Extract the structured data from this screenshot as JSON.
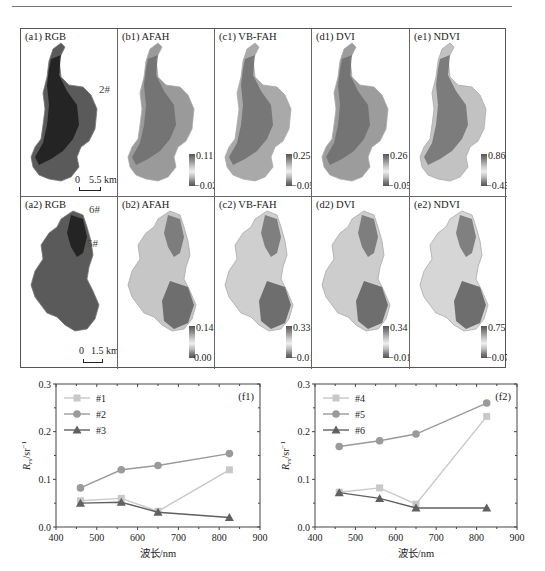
{
  "figure": {
    "row1": [
      {
        "label": "(a1) RGB",
        "type": "rgb",
        "site_tag": "2#",
        "scale": {
          "zero": "0",
          "length": "5.5 km"
        }
      },
      {
        "label": "(b1) AFAH",
        "cbar_max": "0.11",
        "cbar_min": "−0.02"
      },
      {
        "label": "(c1) VB-FAH",
        "cbar_max": "0.25",
        "cbar_min": "−0.05"
      },
      {
        "label": "(d1) DVI",
        "cbar_max": "0.26",
        "cbar_min": "−0.05"
      },
      {
        "label": "(e1) NDVI",
        "cbar_max": "0.86",
        "cbar_min": "−0.43"
      }
    ],
    "row2": [
      {
        "label": "(a2) RGB",
        "type": "rgb",
        "site_tags": [
          "6#",
          "5#"
        ],
        "scale": {
          "zero": "0",
          "length": "1.5 km"
        }
      },
      {
        "label": "(b2) AFAH",
        "cbar_max": "0.14",
        "cbar_min": "0.00"
      },
      {
        "label": "(c2) VB-FAH",
        "cbar_max": "0.33",
        "cbar_min": "−0.01"
      },
      {
        "label": "(d2) DVI",
        "cbar_max": "0.34",
        "cbar_min": "−0.01"
      },
      {
        "label": "(e2) NDVI",
        "cbar_max": "0.75",
        "cbar_min": "−0.07"
      }
    ]
  },
  "chart_data": [
    {
      "type": "line",
      "title": "(f1)",
      "xlabel": "波长/nm",
      "ylabel": "R_rs/sr^-1",
      "xlim": [
        400,
        900
      ],
      "ylim": [
        0.0,
        0.3
      ],
      "xticks": [
        "400",
        "500",
        "600",
        "700",
        "800",
        "900"
      ],
      "yticks": [
        "0.0",
        "0.1",
        "0.2",
        "0.3"
      ],
      "x": [
        460,
        560,
        650,
        825
      ],
      "series": [
        {
          "name": "#1",
          "marker": "square",
          "color": "#c8c8c8",
          "values": [
            0.055,
            0.06,
            0.033,
            0.12
          ]
        },
        {
          "name": "#2",
          "marker": "circle",
          "color": "#9a9a9a",
          "values": [
            0.082,
            0.12,
            0.129,
            0.154
          ]
        },
        {
          "name": "#3",
          "marker": "triangle",
          "color": "#606060",
          "values": [
            0.05,
            0.052,
            0.031,
            0.02
          ]
        }
      ],
      "legend_position": "upper-left",
      "grid": false
    },
    {
      "type": "line",
      "title": "(f2)",
      "xlabel": "波长/nm",
      "ylabel": "R_rs/sr^-1",
      "xlim": [
        400,
        900
      ],
      "ylim": [
        0.0,
        0.3
      ],
      "xticks": [
        "400",
        "500",
        "600",
        "700",
        "800",
        "900"
      ],
      "yticks": [
        "0.0",
        "0.1",
        "0.2",
        "0.3"
      ],
      "x": [
        460,
        560,
        650,
        825
      ],
      "series": [
        {
          "name": "#4",
          "marker": "square",
          "color": "#c8c8c8",
          "values": [
            0.073,
            0.082,
            0.048,
            0.232
          ]
        },
        {
          "name": "#5",
          "marker": "circle",
          "color": "#9a9a9a",
          "values": [
            0.169,
            0.181,
            0.195,
            0.26
          ]
        },
        {
          "name": "#6",
          "marker": "triangle",
          "color": "#606060",
          "values": [
            0.072,
            0.06,
            0.04,
            0.04
          ]
        }
      ],
      "legend_position": "upper-left",
      "grid": false
    }
  ]
}
